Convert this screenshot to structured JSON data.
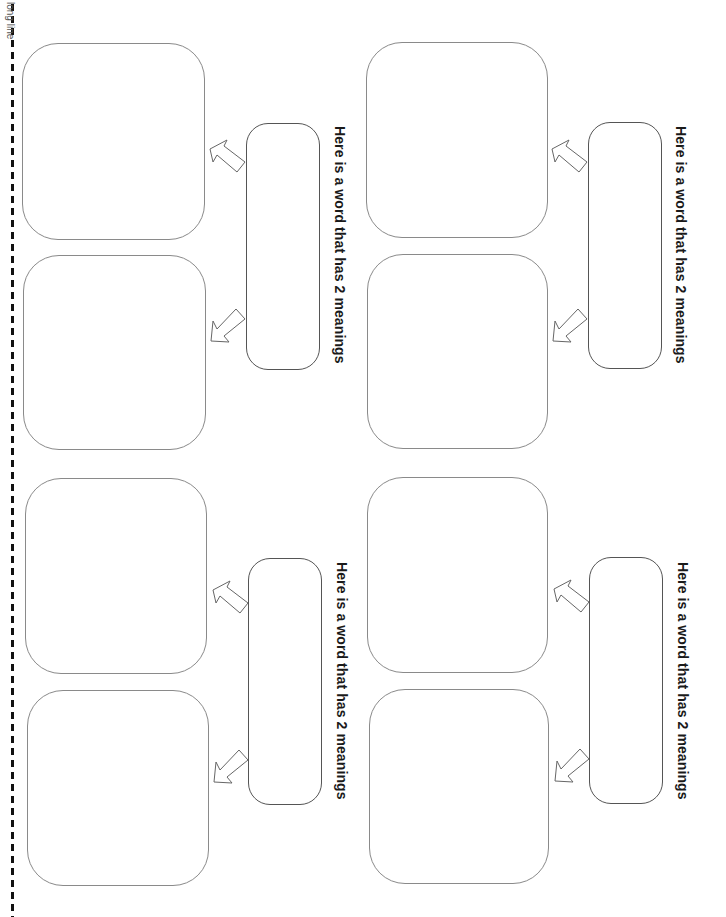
{
  "cut_line": {
    "label": "long line",
    "style": "dashed",
    "color": "#111111"
  },
  "prompt_text": "Here is a word that has 2 meanings",
  "groups": [
    {
      "id": "top-left",
      "prompt": "Here is a word that has 2 meanings",
      "meaning_boxes": [
        "",
        ""
      ],
      "word_box": ""
    },
    {
      "id": "top-right",
      "prompt": "Here is a word that has 2 meanings",
      "meaning_boxes": [
        "",
        ""
      ],
      "word_box": ""
    },
    {
      "id": "bottom-left",
      "prompt": "Here is a word that has 2 meanings",
      "meaning_boxes": [
        "",
        ""
      ],
      "word_box": ""
    },
    {
      "id": "bottom-right",
      "prompt": "Here is a word that has 2 meanings",
      "meaning_boxes": [
        "",
        ""
      ],
      "word_box": ""
    }
  ],
  "icons": {
    "arrow_upper": "arrow-up-left-icon",
    "arrow_lower": "arrow-down-left-icon"
  },
  "colors": {
    "box_border": "#8a8a8a",
    "word_box_border": "#555555",
    "text": "#1a1a1a"
  }
}
